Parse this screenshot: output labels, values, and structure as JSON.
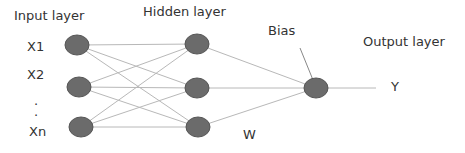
{
  "diagram": {
    "title_labels": {
      "input_layer": "Input layer",
      "hidden_layer": "Hidden layer",
      "output_layer": "Output layer",
      "bias": "Bias",
      "weight": "W"
    },
    "inputs": [
      "X1",
      "X2",
      ".",
      ".",
      "Xn"
    ],
    "output": "Y",
    "colors": {
      "node": "#6b6b6b",
      "node_stroke": "#555555",
      "edge": "#b8b8b8"
    },
    "nodes": {
      "input": [
        [
          77,
          45
        ],
        [
          79,
          87
        ],
        [
          81,
          127
        ]
      ],
      "hidden": [
        [
          197,
          44
        ],
        [
          197,
          88
        ],
        [
          198,
          127
        ]
      ],
      "output": [
        [
          316,
          88
        ]
      ]
    }
  }
}
